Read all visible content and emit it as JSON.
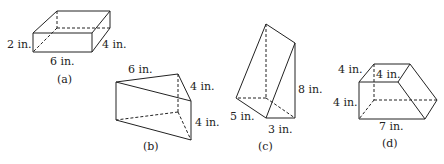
{
  "figures": [
    {
      "id": "a",
      "caption": "(a)",
      "shape": "rectangular box",
      "labels": {
        "height": "2 in.",
        "depth": "4 in.",
        "width": "6 in."
      }
    },
    {
      "id": "b",
      "caption": "(b)",
      "shape": "triangular prism",
      "labels": {
        "length": "6 in.",
        "top_side": "4 in.",
        "height": "4 in."
      }
    },
    {
      "id": "c",
      "caption": "(c)",
      "shape": "triangular prism (upright)",
      "labels": {
        "height": "8 in.",
        "slant": "5 in.",
        "base": "3 in."
      }
    },
    {
      "id": "d",
      "caption": "(d)",
      "shape": "trapezoidal prism",
      "labels": {
        "top_left": "4 in.",
        "top_inner": "4 in.",
        "height": "4 in.",
        "base": "7 in."
      }
    }
  ],
  "colors": {
    "stroke": "#222222",
    "background": "#ffffff"
  }
}
